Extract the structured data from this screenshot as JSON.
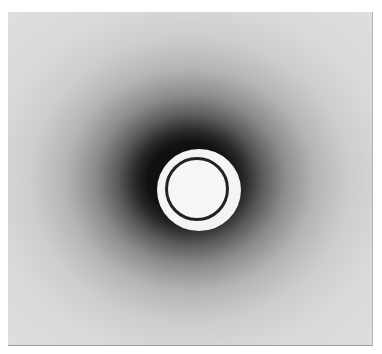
{
  "image": {
    "subject": "circular diffraction halo photograph",
    "colors": {
      "background": "#dcdcdc",
      "halo_core": "#0c0c0c",
      "center": "#f4f4f4"
    }
  }
}
